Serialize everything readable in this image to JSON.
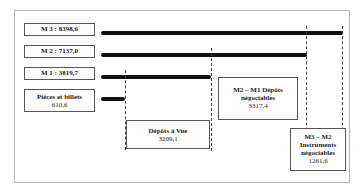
{
  "diagram": {
    "aggregates": [
      {
        "label": "M 3 : 8398,6",
        "name": "M3",
        "value": 8398.6
      },
      {
        "label": "M 2 : 7137,0",
        "name": "M2",
        "value": 7137.0
      },
      {
        "label": "M 1 : 3819,7",
        "name": "M1",
        "value": 3819.7
      },
      {
        "label_line1": "Pièces et billets",
        "label_line2": "610,6",
        "name": "Pièces et billets",
        "value": 610.6
      }
    ],
    "components": [
      {
        "line1": "Dépôts à Vue",
        "line2": "3209,1",
        "value": 3209.1
      },
      {
        "line1": "M2 – M1 Dépôts",
        "line2": "négociables",
        "line3": "3317,4",
        "value": 3317.4
      },
      {
        "line1": "M3 – M2",
        "line2": "Instruments",
        "line3": "négociables",
        "line4": "1261,6",
        "value": 1261.6
      }
    ]
  }
}
